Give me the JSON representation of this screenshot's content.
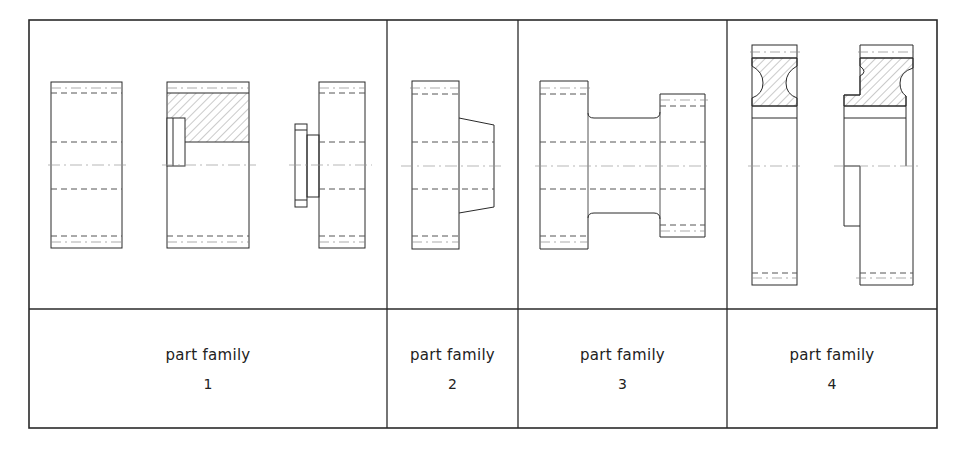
{
  "table": {
    "columns": [
      {
        "id": 1,
        "label": "part family",
        "number": "1",
        "x": 29,
        "width": 358
      },
      {
        "id": 2,
        "label": "part family",
        "number": "2",
        "x": 387,
        "width": 131
      },
      {
        "id": 3,
        "label": "part family",
        "number": "3",
        "x": 518,
        "width": 209
      },
      {
        "id": 4,
        "label": "part family",
        "number": "4",
        "x": 727,
        "width": 210
      }
    ],
    "drawing_row": {
      "top": 20,
      "bottom": 309
    },
    "label_row": {
      "top": 309,
      "bottom": 428
    }
  },
  "colors": {
    "line": "#2a2a2a",
    "hidden_line": "#555555",
    "center_line": "#9a9a9a",
    "hatch": "#777777",
    "background": "#ffffff"
  },
  "labels": {
    "family_1_title": "part family",
    "family_1_number": "1",
    "family_2_title": "part family",
    "family_2_number": "2",
    "family_3_title": "part family",
    "family_3_number": "3",
    "family_4_title": "part family",
    "family_4_number": "4"
  }
}
